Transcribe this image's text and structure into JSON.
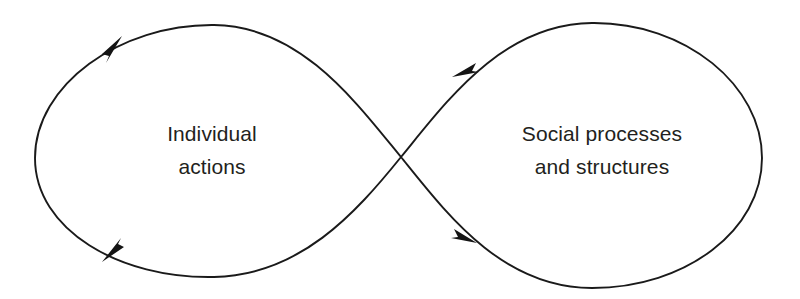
{
  "figure": {
    "type": "feedback-loop-diagram",
    "shape": "figure-eight",
    "background_color": "#ffffff",
    "stroke_color": "#1a1a1a",
    "text_color": "#231f20",
    "nodes": [
      {
        "id": "individual-actions",
        "side": "left",
        "line1": "Individual",
        "line2": "actions"
      },
      {
        "id": "social-processes",
        "side": "right",
        "line1": "Social processes",
        "line2": "and structures"
      }
    ],
    "arrows": [
      {
        "id": "arrow-top-left",
        "position": "upper-left",
        "direction": "up-right"
      },
      {
        "id": "arrow-bottom-left",
        "position": "lower-left",
        "direction": "down-left"
      },
      {
        "id": "arrow-top-right",
        "position": "upper-right",
        "direction": "down-left"
      },
      {
        "id": "arrow-bottom-right",
        "position": "lower-right",
        "direction": "down-right"
      }
    ],
    "crossing_point": {
      "x": 401,
      "y": 157
    }
  }
}
